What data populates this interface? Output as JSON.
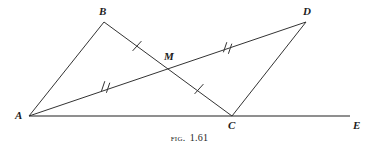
{
  "figure": {
    "caption_prefix": "Fig.",
    "caption_number": "1.61",
    "background_color": "#ffffff",
    "stroke_color": "#333333",
    "baseline_color": "#6a6a6a",
    "label_color": "#1d1d1d"
  },
  "points": {
    "A": {
      "label": "A",
      "x": 29,
      "y": 116,
      "label_x": 15,
      "label_y": 110
    },
    "B": {
      "label": "B",
      "x": 104,
      "y": 22,
      "label_x": 99,
      "label_y": 6
    },
    "C": {
      "label": "C",
      "x": 232,
      "y": 116,
      "label_x": 228,
      "label_y": 120
    },
    "D": {
      "label": "D",
      "x": 306,
      "y": 22,
      "label_x": 303,
      "label_y": 6
    },
    "E": {
      "label": "E",
      "x": 350,
      "y": 116,
      "label_x": 353,
      "label_y": 120
    },
    "M": {
      "label": "M",
      "x": 170,
      "y": 66,
      "label_x": 164,
      "label_y": 51
    }
  },
  "segments": [
    {
      "name": "segment-A-B",
      "from": "A",
      "to": "B",
      "ticks": 0
    },
    {
      "name": "segment-B-M",
      "from": "B",
      "to": "M",
      "ticks": 1
    },
    {
      "name": "segment-M-C",
      "from": "M",
      "to": "C",
      "ticks": 1
    },
    {
      "name": "segment-A-M",
      "from": "A",
      "to": "M",
      "ticks": 2
    },
    {
      "name": "segment-M-D",
      "from": "M",
      "to": "D",
      "ticks": 2
    },
    {
      "name": "segment-C-D",
      "from": "C",
      "to": "D",
      "ticks": 0
    },
    {
      "name": "segment-A-E-baseline",
      "from": "A",
      "to": "E",
      "ticks": 0
    }
  ],
  "tick_marks": [
    {
      "name": "tick-B-M",
      "count": 1,
      "x": 137,
      "y": 46
    },
    {
      "name": "tick-M-C",
      "count": 1,
      "x": 199,
      "y": 89
    },
    {
      "name": "tick-A-M",
      "count": 2,
      "x": 106,
      "y": 87
    },
    {
      "name": "tick-M-D",
      "count": 2,
      "x": 228,
      "y": 47
    }
  ]
}
